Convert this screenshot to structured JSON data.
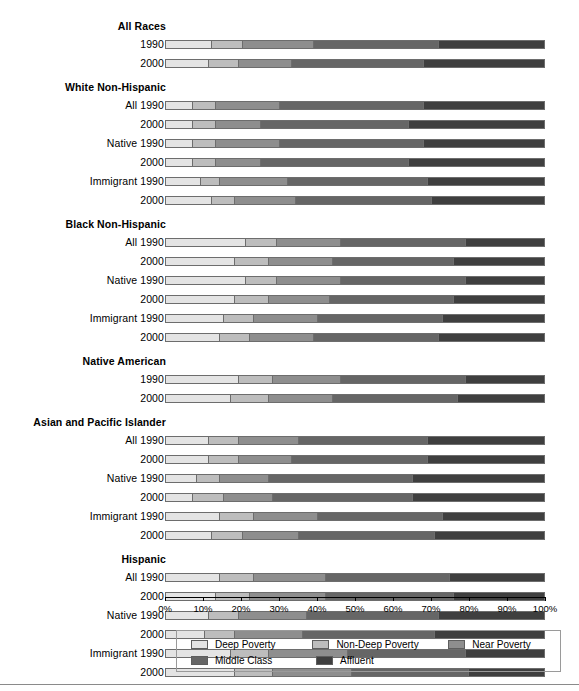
{
  "chart_data": {
    "type": "bar",
    "orientation": "horizontal",
    "stacked": true,
    "stack_mode": "percent",
    "title": "",
    "xlabel": "",
    "ylabel": "",
    "xlim": [
      0,
      100
    ],
    "grid": false,
    "legend_position": "bottom",
    "xticks": [
      "0%",
      "10%",
      "20%",
      "30%",
      "40%",
      "50%",
      "60%",
      "70%",
      "80%",
      "90%",
      "100%"
    ],
    "xtick_values": [
      0,
      10,
      20,
      30,
      40,
      50,
      60,
      70,
      80,
      90,
      100
    ],
    "series": [
      {
        "name": "Deep Poverty",
        "color": "#e4e4e4"
      },
      {
        "name": "Non-Deep Poverty",
        "color": "#bdbdbd"
      },
      {
        "name": "Near Poverty",
        "color": "#8e8e8e"
      },
      {
        "name": "Middle Class",
        "color": "#666666"
      },
      {
        "name": "Affluent",
        "color": "#3f3f3f"
      }
    ],
    "groups": [
      {
        "heading": "All Races",
        "rows": [
          {
            "label": "1990",
            "values": [
              12,
              8,
              19,
              33,
              28
            ]
          },
          {
            "label": "2000",
            "values": [
              11,
              8,
              14,
              35,
              32
            ]
          }
        ]
      },
      {
        "heading": "White Non-Hispanic",
        "rows": [
          {
            "label": "All 1990",
            "values": [
              7,
              6,
              17,
              38,
              32
            ]
          },
          {
            "label": "2000",
            "values": [
              7,
              6,
              12,
              39,
              36
            ]
          },
          {
            "label": "Native 1990",
            "values": [
              7,
              6,
              17,
              38,
              32
            ]
          },
          {
            "label": "2000",
            "values": [
              7,
              6,
              12,
              39,
              36
            ]
          },
          {
            "label": "Immigrant 1990",
            "values": [
              9,
              5,
              18,
              37,
              31
            ]
          },
          {
            "label": "2000",
            "values": [
              12,
              6,
              16,
              36,
              30
            ]
          }
        ]
      },
      {
        "heading": "Black Non-Hispanic",
        "rows": [
          {
            "label": "All 1990",
            "values": [
              21,
              8,
              17,
              33,
              21
            ]
          },
          {
            "label": "2000",
            "values": [
              18,
              9,
              17,
              32,
              24
            ]
          },
          {
            "label": "Native 1990",
            "values": [
              21,
              8,
              17,
              33,
              21
            ]
          },
          {
            "label": "2000",
            "values": [
              18,
              9,
              16,
              33,
              24
            ]
          },
          {
            "label": "Immigrant 1990",
            "values": [
              15,
              8,
              17,
              33,
              27
            ]
          },
          {
            "label": "2000",
            "values": [
              14,
              8,
              17,
              33,
              28
            ]
          }
        ]
      },
      {
        "heading": "Native American",
        "rows": [
          {
            "label": "1990",
            "values": [
              19,
              9,
              18,
              33,
              21
            ]
          },
          {
            "label": "2000",
            "values": [
              17,
              10,
              17,
              33,
              23
            ]
          }
        ]
      },
      {
        "heading": "Asian and Pacific Islander",
        "rows": [
          {
            "label": "All 1990",
            "values": [
              11,
              8,
              16,
              34,
              31
            ]
          },
          {
            "label": "2000",
            "values": [
              11,
              8,
              14,
              36,
              31
            ]
          },
          {
            "label": "Native 1990",
            "values": [
              8,
              6,
              13,
              38,
              35
            ]
          },
          {
            "label": "2000",
            "values": [
              7,
              8,
              13,
              37,
              35
            ]
          },
          {
            "label": "Immigrant 1990",
            "values": [
              14,
              9,
              17,
              33,
              27
            ]
          },
          {
            "label": "2000",
            "values": [
              12,
              8,
              15,
              36,
              29
            ]
          }
        ]
      },
      {
        "heading": "Hispanic",
        "rows": [
          {
            "label": "All 1990",
            "values": [
              14,
              9,
              19,
              33,
              25
            ]
          },
          {
            "label": "2000",
            "values": [
              13,
              9,
              20,
              34,
              24
            ]
          },
          {
            "label": "Native 1990",
            "values": [
              11,
              8,
              18,
              35,
              28
            ]
          },
          {
            "label": "2000",
            "values": [
              10,
              8,
              18,
              35,
              29
            ]
          },
          {
            "label": "Immigrant 1990",
            "values": [
              17,
              10,
              21,
              31,
              21
            ]
          },
          {
            "label": "2000",
            "values": [
              18,
              10,
              21,
              31,
              20
            ]
          }
        ]
      }
    ]
  },
  "legend": {
    "items": [
      {
        "label": "Deep Poverty",
        "swatch": "#e4e4e4"
      },
      {
        "label": "Non-Deep Poverty",
        "swatch": "#bdbdbd"
      },
      {
        "label": "Near Poverty",
        "swatch": "#8e8e8e"
      },
      {
        "label": "Middle Class",
        "swatch": "#666666"
      },
      {
        "label": "Affluent",
        "swatch": "#3f3f3f"
      }
    ]
  }
}
